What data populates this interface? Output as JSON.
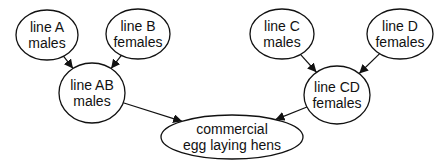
{
  "diagram": {
    "nodes": [
      {
        "id": "lineA",
        "lines": [
          "line A",
          "males"
        ],
        "cx": 47,
        "cy": 35,
        "rx": 31,
        "ry": 25
      },
      {
        "id": "lineB",
        "lines": [
          "line B",
          "females"
        ],
        "cx": 138,
        "cy": 34,
        "rx": 32,
        "ry": 25
      },
      {
        "id": "lineAB",
        "lines": [
          "line AB",
          "males"
        ],
        "cx": 92,
        "cy": 93,
        "rx": 33,
        "ry": 30
      },
      {
        "id": "lineC",
        "lines": [
          "line C",
          "males"
        ],
        "cx": 282,
        "cy": 34,
        "rx": 32,
        "ry": 25
      },
      {
        "id": "lineD",
        "lines": [
          "line D",
          "females"
        ],
        "cx": 400,
        "cy": 34,
        "rx": 33,
        "ry": 25
      },
      {
        "id": "lineCD",
        "lines": [
          "line CD",
          "females"
        ],
        "cx": 337,
        "cy": 95,
        "rx": 33,
        "ry": 29
      },
      {
        "id": "commercial",
        "lines": [
          "commercial",
          "egg laying hens"
        ],
        "cx": 232,
        "cy": 137,
        "rx": 71,
        "ry": 22
      }
    ],
    "edges": [
      {
        "from": "lineA",
        "to": "lineAB"
      },
      {
        "from": "lineB",
        "to": "lineAB"
      },
      {
        "from": "lineC",
        "to": "lineCD"
      },
      {
        "from": "lineD",
        "to": "lineCD"
      },
      {
        "from": "lineAB",
        "to": "commercial"
      },
      {
        "from": "lineCD",
        "to": "commercial"
      }
    ],
    "colors": {
      "stroke": "#111111",
      "fill": "#ffffff",
      "text": "#111111"
    }
  }
}
